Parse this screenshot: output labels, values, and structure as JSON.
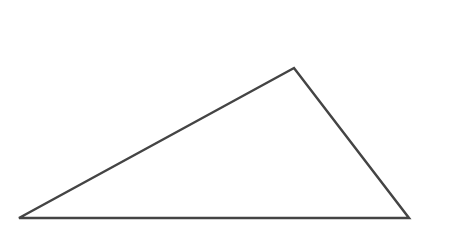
{
  "diagram": {
    "shape": "triangle",
    "stroke_color": "#444444",
    "stroke_width": 2.5,
    "fill": "#ffffff",
    "vertices": [
      {
        "x": 19,
        "y": 218
      },
      {
        "x": 294,
        "y": 68
      },
      {
        "x": 409,
        "y": 218
      }
    ]
  }
}
